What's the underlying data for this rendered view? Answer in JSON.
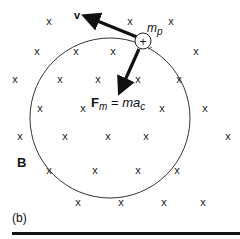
{
  "figure": {
    "panel_label": "(b)",
    "field_label": "B",
    "velocity_label": "v",
    "mass_label_base": "m",
    "mass_label_sub": "p",
    "charge_symbol": "+",
    "force_label": {
      "base": "F",
      "sub": "m",
      "equals": " = ",
      "rhs_base": "ma",
      "rhs_sub": "c"
    },
    "field_symbol": "x",
    "field_direction": "into page",
    "circle": {
      "cx": 110,
      "cy": 118,
      "r": 80
    },
    "particle": {
      "cx": 143,
      "cy": 41,
      "r": 8
    },
    "x_marks": [
      [
        49,
        25
      ],
      [
        130,
        25
      ],
      [
        171,
        25
      ],
      [
        37,
        55
      ],
      [
        76,
        55
      ],
      [
        113,
        55
      ],
      [
        196,
        55
      ],
      [
        15,
        83
      ],
      [
        60,
        83
      ],
      [
        98,
        83
      ],
      [
        138,
        83
      ],
      [
        179,
        83
      ],
      [
        40,
        112
      ],
      [
        83,
        112
      ],
      [
        162,
        112
      ],
      [
        205,
        112
      ],
      [
        20,
        140
      ],
      [
        65,
        140
      ],
      [
        108,
        140
      ],
      [
        146,
        140
      ],
      [
        228,
        140
      ],
      [
        49,
        174
      ],
      [
        95,
        174
      ],
      [
        138,
        174
      ],
      [
        177,
        174
      ],
      [
        78,
        206
      ],
      [
        121,
        206
      ],
      [
        164,
        206
      ],
      [
        203,
        206
      ]
    ],
    "colors": {
      "ink": "#111111",
      "background": "#ffffff"
    }
  }
}
